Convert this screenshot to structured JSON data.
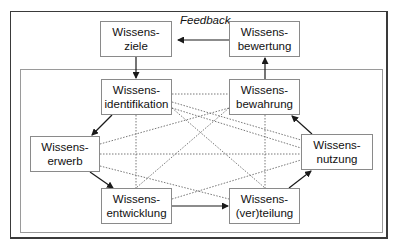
{
  "diagram": {
    "feedback_label": "Feedback",
    "nodes": {
      "ziele": {
        "line1": "Wissens-",
        "line2": "ziele"
      },
      "bewertung": {
        "line1": "Wissens-",
        "line2": "bewertung"
      },
      "identifikation": {
        "line1": "Wissens-",
        "line2": "identifikation"
      },
      "bewahrung": {
        "line1": "Wissens-",
        "line2": "bewahrung"
      },
      "erwerb": {
        "line1": "Wissens-",
        "line2": "erwerb"
      },
      "nutzung": {
        "line1": "Wissens-",
        "line2": "nutzung"
      },
      "entwicklung": {
        "line1": "Wissens-",
        "line2": "entwicklung"
      },
      "verteilung": {
        "line1": "Wissens-",
        "line2": "(ver)teilung"
      }
    },
    "edges_solid": [
      {
        "from": "bewertung",
        "to": "ziele",
        "label": "Feedback"
      },
      {
        "from": "ziele",
        "to": "identifikation"
      },
      {
        "from": "identifikation",
        "to": "erwerb"
      },
      {
        "from": "erwerb",
        "to": "entwicklung"
      },
      {
        "from": "entwicklung",
        "to": "verteilung"
      },
      {
        "from": "verteilung",
        "to": "nutzung"
      },
      {
        "from": "nutzung",
        "to": "bewahrung"
      },
      {
        "from": "bewahrung",
        "to": "bewertung"
      }
    ],
    "edges_dotted": "all pairs among inner six nodes",
    "colors": {
      "line": "#1a1a1a",
      "dotted": "#555555",
      "box_border": "#8a8a8a",
      "outer_frame": "#3a3a3a",
      "inner_frame": "#9a9a9a"
    }
  }
}
